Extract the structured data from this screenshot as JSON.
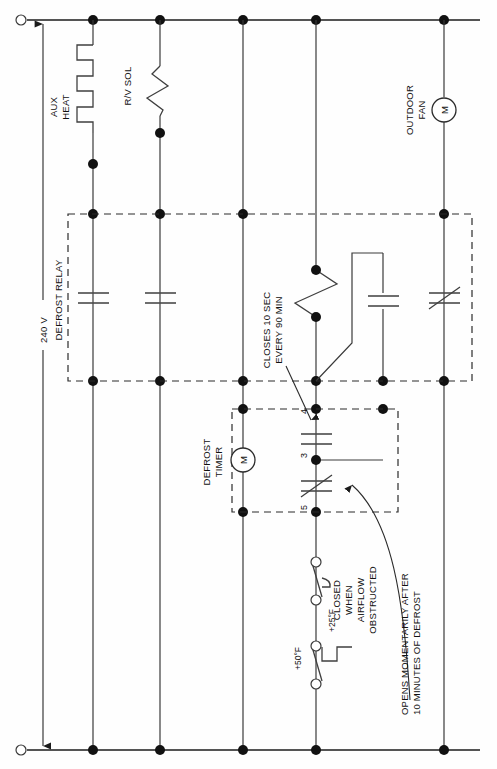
{
  "diagram": {
    "supply_label": "240 V",
    "colors": {
      "wire": "#1b1b1b",
      "component": "#3f3f3f",
      "dashed": "#2b2b2b",
      "background": "#ffffff"
    }
  },
  "loads": {
    "aux_heat_line1": "AUX",
    "aux_heat_line2": "HEAT",
    "rv_sol": "R/V SOL",
    "outdoor_fan_line1": "OUTDOOR",
    "outdoor_fan_line2": "FAN",
    "motor_symbol": "M"
  },
  "relay": {
    "label": "DEFROST RELAY"
  },
  "timer": {
    "label_line1": "DEFROST",
    "label_line2": "TIMER",
    "motor_symbol": "M",
    "terminal_4": "4",
    "terminal_3": "3",
    "terminal_5": "5"
  },
  "annotations": {
    "timer_contact_line1": "CLOSES 10 SEC",
    "timer_contact_line2": "EVERY 90 MIN",
    "defrost_limit_line1": "OPENS MOMENTARILY AFTER",
    "defrost_limit_line2": "10 MINUTES OF DEFROST"
  },
  "switches": {
    "pressure_line1": "CLOSED",
    "pressure_line2": "WHEN",
    "pressure_line3": "AIRFLOW",
    "pressure_line4": "OBSTRUCTED",
    "temp_close": "+25°F",
    "temp_open": "+50°F"
  },
  "icons": {
    "arrow_up": "arrow-up-icon",
    "arrow_down": "arrow-down-icon",
    "terminal": "terminal-circle-icon",
    "junction": "junction-dot-icon"
  }
}
